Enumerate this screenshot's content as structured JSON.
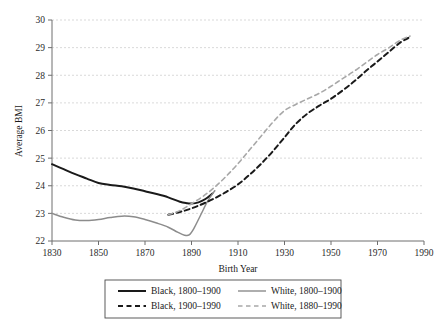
{
  "chart_data": {
    "type": "line",
    "title": "",
    "xlabel": "Birth Year",
    "ylabel": "Average BMI",
    "xlim": [
      1830,
      1990
    ],
    "ylim": [
      22,
      30
    ],
    "xticks": [
      1830,
      1850,
      1870,
      1890,
      1910,
      1930,
      1950,
      1970,
      1990
    ],
    "yticks": [
      22,
      23,
      24,
      25,
      26,
      27,
      28,
      29,
      30
    ],
    "grid": "horizontal-dashed",
    "legend_position": "below-axes",
    "series": [
      {
        "name": "Black, 1800-1900",
        "label": "Black, 1800–1900",
        "color": "#1a1a1a",
        "style": "solid",
        "width": 2.0,
        "x": [
          1830,
          1835,
          1840,
          1845,
          1850,
          1855,
          1860,
          1865,
          1870,
          1875,
          1880,
          1885,
          1888,
          1890,
          1893,
          1896,
          1899
        ],
        "y": [
          24.78,
          24.6,
          24.42,
          24.26,
          24.1,
          24.03,
          23.98,
          23.9,
          23.8,
          23.7,
          23.58,
          23.42,
          23.37,
          23.36,
          23.4,
          23.52,
          23.72
        ]
      },
      {
        "name": "White, 1800-1900",
        "label": "White, 1800–1900",
        "color": "#8c8c8c",
        "style": "solid",
        "width": 1.5,
        "x": [
          1830,
          1835,
          1840,
          1845,
          1850,
          1855,
          1860,
          1865,
          1870,
          1875,
          1880,
          1884,
          1887,
          1889,
          1891,
          1894,
          1897,
          1900
        ],
        "y": [
          23.0,
          22.86,
          22.76,
          22.74,
          22.78,
          22.85,
          22.9,
          22.88,
          22.78,
          22.65,
          22.5,
          22.32,
          22.21,
          22.22,
          22.45,
          22.95,
          23.45,
          23.82
        ]
      },
      {
        "name": "Black, 1900-1990",
        "label": "Black, 1900–1990",
        "color": "#1a1a1a",
        "style": "dashed",
        "width": 2.0,
        "x": [
          1880,
          1885,
          1890,
          1895,
          1900,
          1905,
          1910,
          1915,
          1920,
          1925,
          1930,
          1935,
          1940,
          1945,
          1950,
          1955,
          1960,
          1965,
          1970,
          1975,
          1980,
          1984
        ],
        "y": [
          22.95,
          23.05,
          23.18,
          23.35,
          23.55,
          23.78,
          24.05,
          24.4,
          24.8,
          25.25,
          25.75,
          26.25,
          26.62,
          26.9,
          27.15,
          27.45,
          27.78,
          28.15,
          28.5,
          28.85,
          29.2,
          29.38
        ]
      },
      {
        "name": "White, 1880-1990",
        "label": "White, 1880–1990",
        "color": "#a8a8a8",
        "style": "dashed",
        "width": 1.6,
        "x": [
          1880,
          1885,
          1890,
          1895,
          1900,
          1905,
          1910,
          1915,
          1920,
          1925,
          1930,
          1935,
          1940,
          1945,
          1950,
          1955,
          1960,
          1965,
          1970,
          1975,
          1980,
          1984
        ],
        "y": [
          22.95,
          23.1,
          23.35,
          23.62,
          23.95,
          24.35,
          24.8,
          25.3,
          25.8,
          26.3,
          26.72,
          26.95,
          27.15,
          27.35,
          27.6,
          27.88,
          28.15,
          28.45,
          28.75,
          29.0,
          29.28,
          29.42
        ]
      }
    ]
  },
  "legend": {
    "entries": [
      {
        "label": "Black, 1800–1900",
        "color": "#1a1a1a",
        "style": "solid"
      },
      {
        "label": "White, 1800–1900",
        "color": "#8c8c8c",
        "style": "solid"
      },
      {
        "label": "Black, 1900–1990",
        "color": "#1a1a1a",
        "style": "dashed"
      },
      {
        "label": "White, 1880–1990",
        "color": "#a8a8a8",
        "style": "dashed"
      }
    ]
  },
  "colors": {
    "axis": "#6e6e6e",
    "grid": "#cfcfcf",
    "text": "#1a1a1a",
    "background": "#ffffff"
  }
}
